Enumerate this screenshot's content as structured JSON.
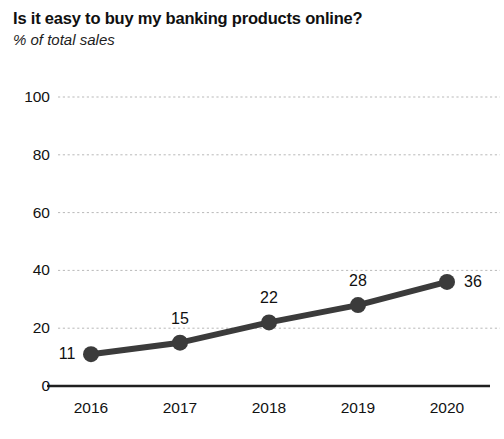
{
  "chart_data": {
    "type": "line",
    "title": "Is it easy to buy my banking products online?",
    "subtitle": "% of total sales",
    "xlabel": "",
    "ylabel": "",
    "categories": [
      "2016",
      "2017",
      "2018",
      "2019",
      "2020"
    ],
    "values": [
      11,
      15,
      22,
      28,
      36
    ],
    "point_labels": [
      "11",
      "15",
      "22",
      "28",
      "36"
    ],
    "point_label_positions": [
      "left",
      "top",
      "top",
      "top",
      "right"
    ],
    "ylim": [
      0,
      100
    ],
    "yticks": [
      0,
      20,
      40,
      60,
      80,
      100
    ],
    "ytick_labels": [
      "0",
      "20",
      "40",
      "60",
      "80",
      "100"
    ],
    "grid": true,
    "grid_axis": "y",
    "legend": false,
    "series_color": "#3b3b3b",
    "grid_color": "#b9b9b9",
    "axis_color": "#202020",
    "background_color": "#ffffff",
    "marker": "circle",
    "marker_size": 8,
    "line_width": 6
  }
}
